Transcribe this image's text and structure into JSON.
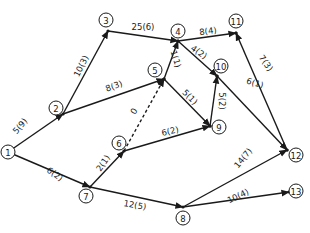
{
  "diagram": {
    "type": "activity-network",
    "nodes": [
      {
        "id": "1",
        "label": "1",
        "x": 8,
        "y": 152,
        "cx": 8,
        "cy": 152
      },
      {
        "id": "2",
        "label": "2",
        "x": 56,
        "y": 108,
        "cx": 63,
        "cy": 114
      },
      {
        "id": "3",
        "label": "3",
        "x": 106,
        "y": 20,
        "cx": 108,
        "cy": 31
      },
      {
        "id": "4",
        "label": "4",
        "x": 178,
        "y": 31,
        "cx": 178,
        "cy": 41
      },
      {
        "id": "5",
        "label": "5",
        "x": 155,
        "y": 70,
        "cx": 164,
        "cy": 79
      },
      {
        "id": "6",
        "label": "6",
        "x": 119,
        "y": 143,
        "cx": 124,
        "cy": 151
      },
      {
        "id": "7",
        "label": "7",
        "x": 86,
        "y": 196,
        "cx": 90,
        "cy": 187
      },
      {
        "id": "8",
        "label": "8",
        "x": 183,
        "y": 218,
        "cx": 183,
        "cy": 207
      },
      {
        "id": "9",
        "label": "9",
        "x": 219,
        "y": 127,
        "cx": 210,
        "cy": 126
      },
      {
        "id": "10",
        "label": "10",
        "x": 221,
        "y": 66,
        "cx": 217,
        "cy": 76
      },
      {
        "id": "11",
        "label": "11",
        "x": 236,
        "y": 21,
        "cx": 236,
        "cy": 33
      },
      {
        "id": "12",
        "label": "12",
        "x": 296,
        "y": 155,
        "cx": 287,
        "cy": 150
      },
      {
        "id": "13",
        "label": "13",
        "x": 296,
        "y": 191,
        "cx": 289,
        "cy": 192
      }
    ],
    "edges": [
      {
        "from": "1",
        "to": "2",
        "label": "5(9)",
        "lx": 20,
        "ly": 126,
        "rot": -50,
        "dashed": false
      },
      {
        "from": "1",
        "to": "7",
        "label": "6(2)",
        "lx": 55,
        "ly": 174,
        "rot": 35,
        "dashed": false
      },
      {
        "from": "2",
        "to": "3",
        "label": "10(3)",
        "lx": 81,
        "ly": 66,
        "rot": -64,
        "dashed": false
      },
      {
        "from": "2",
        "to": "5",
        "label": "8(3)",
        "lx": 114,
        "ly": 86,
        "rot": -20,
        "dashed": false
      },
      {
        "from": "3",
        "to": "4",
        "label": "25(6)",
        "lx": 143,
        "ly": 27,
        "rot": 0,
        "dashed": false
      },
      {
        "from": "5",
        "to": "4",
        "label": "1(1)",
        "lx": 176,
        "ly": 59,
        "rot": 72,
        "dashed": false
      },
      {
        "from": "4",
        "to": "11",
        "label": "8(4)",
        "lx": 208,
        "ly": 31,
        "rot": -8,
        "dashed": false
      },
      {
        "from": "4",
        "to": "10",
        "label": "4(2)",
        "lx": 199,
        "ly": 52,
        "rot": 35,
        "dashed": false
      },
      {
        "from": "6",
        "to": "5",
        "label": "0",
        "lx": 134,
        "ly": 111,
        "rot": -58,
        "dashed": true
      },
      {
        "from": "5",
        "to": "9",
        "label": "5(1)",
        "lx": 190,
        "ly": 97,
        "rot": 45,
        "dashed": false
      },
      {
        "from": "9",
        "to": "10",
        "label": "5(2)",
        "lx": 222,
        "ly": 101,
        "rot": 90,
        "dashed": false
      },
      {
        "from": "10",
        "to": "12",
        "label": "6(1)",
        "lx": 255,
        "ly": 83,
        "rot": 17,
        "dashed": false
      },
      {
        "from": "12",
        "to": "11",
        "label": "7(3)",
        "lx": 266,
        "ly": 63,
        "rot": 55,
        "dashed": false
      },
      {
        "from": "7",
        "to": "6",
        "label": "2(1)",
        "lx": 103,
        "ly": 163,
        "rot": -55,
        "dashed": false
      },
      {
        "from": "6",
        "to": "9",
        "label": "6(2)",
        "lx": 170,
        "ly": 131,
        "rot": -13,
        "dashed": false
      },
      {
        "from": "7",
        "to": "8",
        "label": "12(5)",
        "lx": 135,
        "ly": 205,
        "rot": 10,
        "dashed": false
      },
      {
        "from": "8",
        "to": "12",
        "label": "14(7)",
        "lx": 243,
        "ly": 158,
        "rot": -50,
        "dashed": false
      },
      {
        "from": "8",
        "to": "13",
        "label": "10(4)",
        "lx": 238,
        "ly": 196,
        "rot": -25,
        "dashed": false
      }
    ]
  },
  "colors": {
    "ink": "#1a1a1a",
    "background": "#ffffff"
  }
}
